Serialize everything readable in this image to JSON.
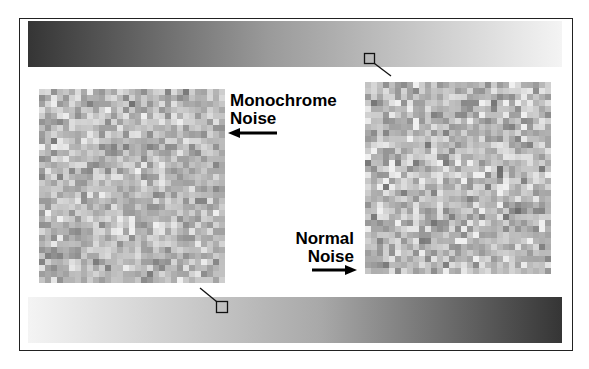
{
  "labels": {
    "monochrome_line1": "Monochrome",
    "monochrome_line2": "Noise",
    "normal_line1": "Normal",
    "normal_line2": "Noise"
  },
  "colors": {
    "frame": "#222222",
    "gradient_dark": "#353535",
    "gradient_light": "#f4f4f4",
    "noise_base": "#b9b9b9",
    "text": "#000000"
  },
  "gradients": {
    "top": {
      "direction": "dark-to-light"
    },
    "bottom": {
      "direction": "light-to-dark"
    }
  },
  "noise_panels": {
    "monochrome": {
      "cell_px": 6
    },
    "normal": {
      "cell_px": 6
    }
  }
}
